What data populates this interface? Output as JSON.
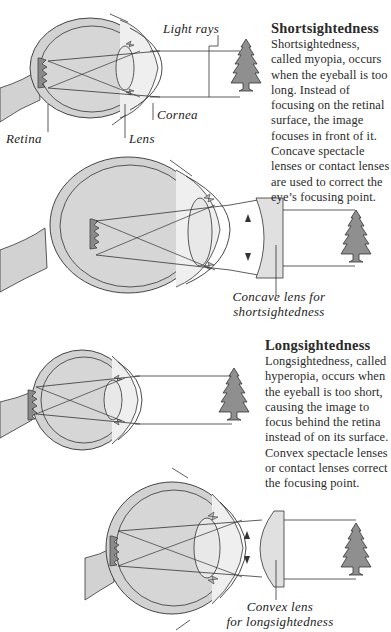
{
  "sections": [
    {
      "id": "shortsightedness",
      "title": "Shortsightedness",
      "body": "Shortsightedness, called myopia, occurs when the eyeball is too long. Instead of focusing on the retinal surface, the image focuses in front of it. Concave spectacle lenses or contact lenses are used to correct the eye’s focusing point.",
      "labels": {
        "light_rays": "Light rays",
        "cornea": "Cornea",
        "retina": "Retina",
        "lens": "Lens"
      },
      "corrective_caption_line1": "Concave lens for",
      "corrective_caption_line2": "shortsightedness"
    },
    {
      "id": "longsightedness",
      "title": "Longsightedness",
      "body": "Longsightedness, called hyperopia, occurs when the eyeball is too short, causing the image to focus behind the retina instead of on its surface. Convex spectacle lenses or contact lenses correct the focusing point.",
      "corrective_caption_line1": "Convex lens",
      "corrective_caption_line2": "for longsightedness"
    }
  ],
  "colors": {
    "eye_fill": "#d2d2d2",
    "eye_light": "#e8e8e8",
    "tree_fill": "#8f8f8f",
    "line": "#333333",
    "text": "#2a2a2a"
  }
}
